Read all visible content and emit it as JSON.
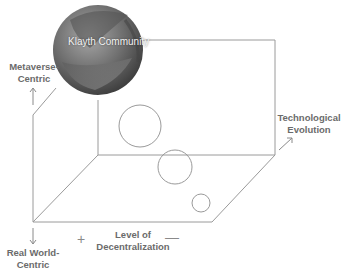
{
  "diagram": {
    "sphere_label": "Klayth Community",
    "axes": {
      "top_label_line1": "Metaverse-",
      "top_label_line2": "Centric",
      "bottom_label_line1": "Real World-",
      "bottom_label_line2": "Centric",
      "x_label_line1": "Level of",
      "x_label_line2": "Decentralization",
      "x_plus": "+",
      "x_minus": "—",
      "depth_label_line1": "Technological",
      "depth_label_line2": "Evolution"
    },
    "circles": [
      {
        "name": "large",
        "cx": 140,
        "cy": 126,
        "r": 21
      },
      {
        "name": "medium",
        "cx": 175,
        "cy": 167,
        "r": 17
      },
      {
        "name": "small",
        "cx": 201,
        "cy": 203,
        "r": 9
      }
    ],
    "colors": {
      "line": "#9a9a9a",
      "text": "#6b6b6b",
      "sphere_dark": "#3a3a3a",
      "sphere_light": "#9a9a9a"
    }
  }
}
